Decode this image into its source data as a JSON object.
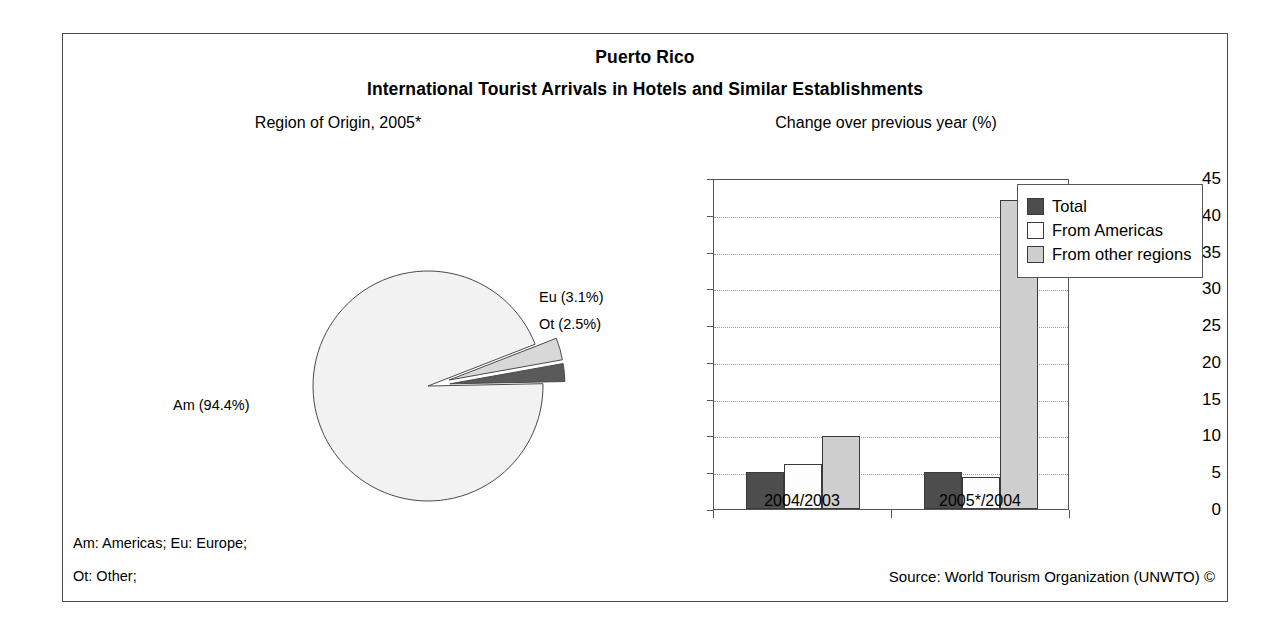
{
  "figure": {
    "country_title": "Puerto Rico",
    "main_title": "International Tourist Arrivals in Hotels and Similar Establishments",
    "pie_subtitle": "Region of Origin, 2005*",
    "bar_subtitle": "Change over previous year (%)",
    "note_line1": "Am: Americas; Eu: Europe;",
    "note_line2": "Ot: Other;",
    "source": "Source: World Tourism Organization (UNWTO) ©"
  },
  "colors": {
    "total": "#4d4d4d",
    "from_americas": "#fdfdfd",
    "from_other_regions": "#cfcfcf",
    "pie_am": "#f2f2f2",
    "pie_eu": "#d8d8d8",
    "pie_ot": "#5a5a5a",
    "axis": "#555555",
    "grid": "#9a9a9a",
    "border": "#4a4a4a"
  },
  "chart_data": [
    {
      "type": "pie",
      "title": "Region of Origin, 2005*",
      "labels": [
        "Am",
        "Eu",
        "Ot"
      ],
      "label_texts": [
        "Am (94.4%)",
        "Eu (3.1%)",
        "Ot (2.5%)"
      ],
      "values": [
        94.4,
        3.1,
        2.5
      ],
      "units": "%",
      "exploded": [
        "Eu",
        "Ot"
      ],
      "legend": "none"
    },
    {
      "type": "bar",
      "title": "Change over previous year (%)",
      "categories": [
        "2004/2003",
        "2005*/2004"
      ],
      "series": [
        {
          "name": "Total",
          "values": [
            5.1,
            5.0
          ]
        },
        {
          "name": "From Americas",
          "values": [
            6.1,
            4.4
          ]
        },
        {
          "name": "From other regions",
          "values": [
            9.9,
            42.0
          ]
        }
      ],
      "xlabel": "",
      "ylabel": "",
      "ylim": [
        0,
        45
      ],
      "yticks": [
        0,
        5,
        10,
        15,
        20,
        25,
        30,
        35,
        40,
        45
      ],
      "grid": true,
      "legend_position": "top-right"
    }
  ]
}
